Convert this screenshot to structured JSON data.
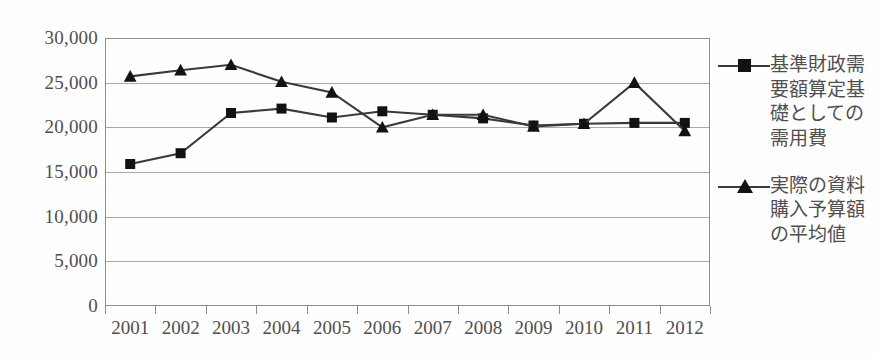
{
  "chart_data": {
    "type": "line",
    "title": "",
    "xlabel": "",
    "ylabel": "",
    "categories": [
      "2001",
      "2002",
      "2003",
      "2004",
      "2005",
      "2006",
      "2007",
      "2008",
      "2009",
      "2010",
      "2011",
      "2012"
    ],
    "ylim": [
      0,
      30000
    ],
    "ytick_values": [
      30000,
      25000,
      20000,
      15000,
      10000,
      5000,
      0
    ],
    "ytick_labels": [
      "30,000",
      "25,000",
      "20,000",
      "15,000",
      "10,000",
      "5,000",
      "0"
    ],
    "grid": true,
    "legend_position": "right",
    "series": [
      {
        "name": "基準財政需要額算定基礎としての需用費",
        "marker": "square",
        "color": "#3a3a3a",
        "values": [
          15900,
          17100,
          21600,
          22100,
          21100,
          21800,
          21400,
          21000,
          20200,
          20400,
          20500,
          20500
        ]
      },
      {
        "name": "実際の資料購入予算額の平均値",
        "marker": "triangle",
        "color": "#3a3a3a",
        "values": [
          25700,
          26400,
          27000,
          25100,
          23900,
          20000,
          21400,
          21400,
          20100,
          20400,
          25000,
          19600
        ]
      }
    ]
  },
  "legend": {
    "entries": [
      {
        "label": "基準財政需要額算定基礎としての需用費",
        "marker": "square-line-marker"
      },
      {
        "label": "実際の資料購入予算額の平均値",
        "marker": "triangle-line-marker"
      }
    ]
  },
  "colors": {
    "series_line": "#3a3a3a",
    "marker_fill": "#121212",
    "gridline": "#aaaaaa",
    "axis": "#8d8d8d",
    "text": "#4f4f4f",
    "background": "#fefefe"
  }
}
